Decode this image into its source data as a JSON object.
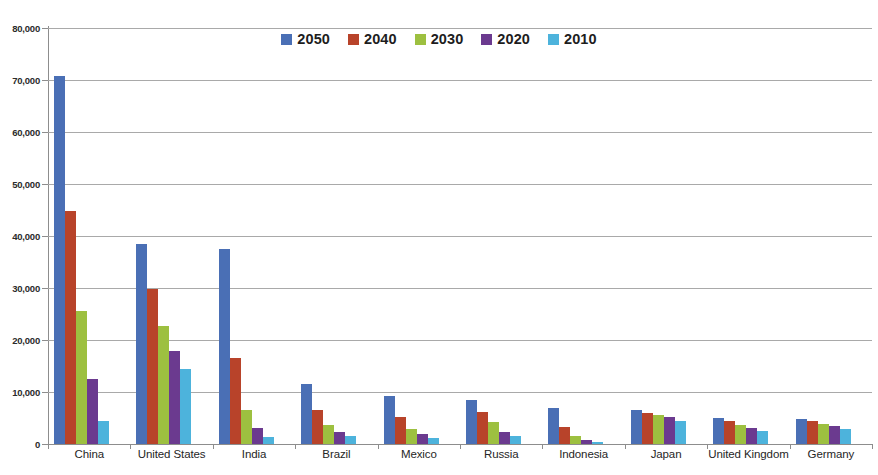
{
  "chart_data": {
    "type": "bar",
    "title": "",
    "subtitle": "",
    "xlabel": "",
    "ylabel": "",
    "ylim": [
      0,
      80000
    ],
    "y_ticks": [
      0,
      10000,
      20000,
      30000,
      40000,
      50000,
      60000,
      70000,
      80000
    ],
    "y_tick_labels": [
      "0",
      "10,000",
      "20,000",
      "30,000",
      "40,000",
      "50,000",
      "60,000",
      "70,000",
      "80,000"
    ],
    "grid": true,
    "legend_position": "top-center",
    "categories": [
      "China",
      "United States",
      "India",
      "Brazil",
      "Mexico",
      "Russia",
      "Indonesia",
      "Japan",
      "United Kingdom",
      "Germany"
    ],
    "series": [
      {
        "name": "2050",
        "color": "#4a6fb5",
        "values": [
          70800,
          38500,
          37500,
          11500,
          9300,
          8400,
          6900,
          6500,
          5000,
          4900
        ]
      },
      {
        "name": "2040",
        "color": "#b8432a",
        "values": [
          44900,
          29800,
          16500,
          6500,
          5200,
          6100,
          3200,
          6000,
          4500,
          4400
        ]
      },
      {
        "name": "2030",
        "color": "#9dc040",
        "values": [
          25500,
          22600,
          6500,
          3700,
          2900,
          4200,
          1600,
          5600,
          3700,
          3800
        ]
      },
      {
        "name": "2020",
        "color": "#6b3a8f",
        "values": [
          12500,
          17900,
          3000,
          2400,
          1900,
          2300,
          700,
          5100,
          3000,
          3400
        ]
      },
      {
        "name": "2010",
        "color": "#4db3dc",
        "values": [
          4500,
          14500,
          1300,
          1600,
          1200,
          1600,
          300,
          4500,
          2500,
          2900
        ]
      }
    ]
  },
  "legend": {
    "items": [
      {
        "label": "2050",
        "color": "#4a6fb5"
      },
      {
        "label": "2040",
        "color": "#b8432a"
      },
      {
        "label": "2030",
        "color": "#9dc040"
      },
      {
        "label": "2020",
        "color": "#6b3a8f"
      },
      {
        "label": "2010",
        "color": "#4db3dc"
      }
    ]
  }
}
